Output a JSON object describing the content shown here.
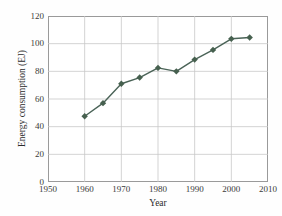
{
  "figure": {
    "background_color": "#ffffff",
    "frame_color": "#9a9a9a",
    "grid_color": "#c8c8c8",
    "title_remnant": "",
    "plot": {
      "left": 48,
      "top": 16,
      "width": 220,
      "height": 166
    }
  },
  "axes": {
    "x": {
      "label": "Year",
      "ticks": [
        "1950",
        "1960",
        "1970",
        "1980",
        "1990",
        "2000",
        "2010"
      ],
      "min": 1950,
      "max": 2010,
      "step": 10,
      "grid": true
    },
    "y": {
      "label": "Energy consumption (EJ)",
      "ticks": [
        "0",
        "20",
        "40",
        "60",
        "80",
        "100",
        "120"
      ],
      "min": 0,
      "max": 120,
      "step": 20,
      "grid": true
    }
  },
  "series_style": {
    "line_color": "#4a6357",
    "line_width": 1.4,
    "marker": "diamond",
    "marker_size": 3.2,
    "marker_color": "#46604f"
  },
  "chart_data": {
    "type": "line",
    "title": "",
    "xlabel": "Year",
    "ylabel": "Energy consumption (EJ)",
    "xlim": [
      1950,
      2010
    ],
    "ylim": [
      0,
      120
    ],
    "xticks": [
      1950,
      1960,
      1970,
      1980,
      1990,
      2000,
      2010
    ],
    "yticks": [
      0,
      20,
      40,
      60,
      80,
      100,
      120
    ],
    "grid": true,
    "legend": null,
    "x": [
      1960,
      1965,
      1970,
      1975,
      1980,
      1985,
      1990,
      1995,
      2000,
      2005
    ],
    "series": [
      {
        "name": "Energy consumption",
        "values": [
          47.5,
          57.0,
          71.0,
          75.5,
          82.5,
          80.0,
          88.5,
          95.5,
          103.5,
          104.5
        ]
      }
    ]
  }
}
